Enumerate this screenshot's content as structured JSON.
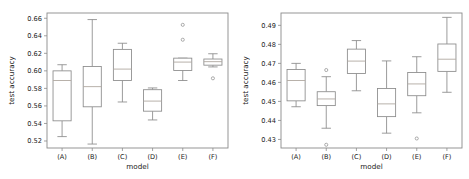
{
  "figure": {
    "panel_count": 2,
    "background_color": "#ffffff",
    "line_color": "#8a8a8a",
    "median_color": "#b0a8a0"
  },
  "chart_data": [
    {
      "type": "box",
      "panel": "left",
      "title": "",
      "xlabel": "model",
      "ylabel": "test accuracy",
      "categories": [
        "(A)",
        "(B)",
        "(C)",
        "(D)",
        "(E)",
        "(F)"
      ],
      "ylim": [
        0.512,
        0.666
      ],
      "yticks": [
        0.52,
        0.54,
        0.56,
        0.58,
        0.6,
        0.62,
        0.64,
        0.66
      ],
      "ytick_labels": [
        "0.52",
        "0.54",
        "0.56",
        "0.58",
        "0.60",
        "0.62",
        "0.64",
        "0.66"
      ],
      "grid": false,
      "legend": false,
      "boxes": [
        {
          "label": "(A)",
          "whisker_low": 0.525,
          "q1": 0.543,
          "median": 0.589,
          "q3": 0.6,
          "whisker_high": 0.607,
          "outliers": []
        },
        {
          "label": "(B)",
          "whisker_low": 0.5165,
          "q1": 0.559,
          "median": 0.582,
          "q3": 0.605,
          "whisker_high": 0.6585,
          "outliers": []
        },
        {
          "label": "(C)",
          "whisker_low": 0.5645,
          "q1": 0.589,
          "median": 0.602,
          "q3": 0.6245,
          "whisker_high": 0.6315,
          "outliers": []
        },
        {
          "label": "(D)",
          "whisker_low": 0.544,
          "q1": 0.554,
          "median": 0.5655,
          "q3": 0.5785,
          "whisker_high": 0.5805,
          "outliers": []
        },
        {
          "label": "(E)",
          "whisker_low": 0.589,
          "q1": 0.6005,
          "median": 0.61,
          "q3": 0.6145,
          "whisker_high": 0.6145,
          "outliers": [
            0.6525,
            0.6355
          ]
        },
        {
          "label": "(F)",
          "whisker_low": 0.6045,
          "q1": 0.6065,
          "median": 0.6105,
          "q3": 0.6135,
          "whisker_high": 0.6195,
          "outliers": [
            0.5915
          ]
        }
      ]
    },
    {
      "type": "box",
      "panel": "right",
      "title": "",
      "xlabel": "model",
      "ylabel": "test accuracy",
      "categories": [
        "(A)",
        "(B)",
        "(C)",
        "(D)",
        "(E)",
        "(F)"
      ],
      "ylim": [
        0.4255,
        0.4965
      ],
      "yticks": [
        0.43,
        0.44,
        0.45,
        0.46,
        0.47,
        0.48,
        0.49
      ],
      "ytick_labels": [
        "0.43",
        "0.44",
        "0.45",
        "0.46",
        "0.47",
        "0.48",
        "0.49"
      ],
      "grid": false,
      "legend": false,
      "boxes": [
        {
          "label": "(A)",
          "whisker_low": 0.4472,
          "q1": 0.4503,
          "median": 0.461,
          "q3": 0.4668,
          "whisker_high": 0.47,
          "outliers": []
        },
        {
          "label": "(B)",
          "whisker_low": 0.4359,
          "q1": 0.4478,
          "median": 0.4513,
          "q3": 0.4551,
          "whisker_high": 0.463,
          "outliers": [
            0.4665,
            0.4272
          ]
        },
        {
          "label": "(C)",
          "whisker_low": 0.4556,
          "q1": 0.4647,
          "median": 0.4712,
          "q3": 0.4775,
          "whisker_high": 0.482,
          "outliers": []
        },
        {
          "label": "(D)",
          "whisker_low": 0.4333,
          "q1": 0.442,
          "median": 0.4487,
          "q3": 0.4568,
          "whisker_high": 0.4713,
          "outliers": []
        },
        {
          "label": "(E)",
          "whisker_low": 0.444,
          "q1": 0.453,
          "median": 0.4592,
          "q3": 0.4652,
          "whisker_high": 0.4735,
          "outliers": [
            0.4305
          ]
        },
        {
          "label": "(F)",
          "whisker_low": 0.4548,
          "q1": 0.4658,
          "median": 0.4722,
          "q3": 0.4802,
          "whisker_high": 0.4942,
          "outliers": []
        }
      ]
    }
  ]
}
